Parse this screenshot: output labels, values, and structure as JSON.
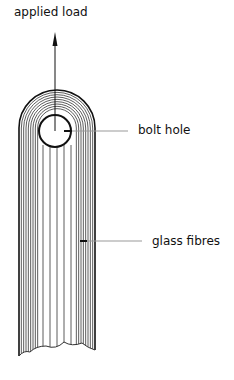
{
  "diagram": {
    "labels": {
      "applied_load": "applied load",
      "bolt_hole": "bolt hole",
      "glass_fibres": "glass fibres"
    },
    "fibre_count": 8,
    "colors": {
      "line": "#111111",
      "leader": "#999999"
    }
  }
}
